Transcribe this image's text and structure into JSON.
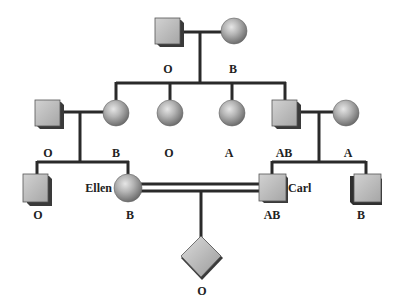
{
  "generations": [
    {
      "name": "grandparents",
      "individuals": [
        {
          "id": "gp-male",
          "sex": "male",
          "shape": "square",
          "blood_type": "O"
        },
        {
          "id": "gp-female",
          "sex": "female",
          "shape": "circle",
          "blood_type": "B"
        }
      ]
    },
    {
      "name": "parents",
      "individuals": [
        {
          "id": "p-left-husband",
          "sex": "male",
          "shape": "square",
          "blood_type": "O"
        },
        {
          "id": "p-daughter-1",
          "sex": "female",
          "shape": "circle",
          "blood_type": "B"
        },
        {
          "id": "p-daughter-2",
          "sex": "female",
          "shape": "circle",
          "blood_type": "O"
        },
        {
          "id": "p-daughter-3",
          "sex": "female",
          "shape": "circle",
          "blood_type": "A"
        },
        {
          "id": "p-son",
          "sex": "male",
          "shape": "square",
          "blood_type": "AB"
        },
        {
          "id": "p-right-wife",
          "sex": "female",
          "shape": "circle",
          "blood_type": "A"
        }
      ]
    },
    {
      "name": "children",
      "individuals": [
        {
          "id": "c-left-son",
          "sex": "male",
          "shape": "square",
          "blood_type": "O"
        },
        {
          "id": "c-ellen",
          "sex": "female",
          "shape": "circle",
          "blood_type": "B",
          "name": "Ellen"
        },
        {
          "id": "c-carl",
          "sex": "male",
          "shape": "square",
          "blood_type": "AB",
          "name": "Carl"
        },
        {
          "id": "c-right-son",
          "sex": "male",
          "shape": "square",
          "blood_type": "B"
        }
      ]
    },
    {
      "name": "offspring",
      "individuals": [
        {
          "id": "o-child",
          "sex": "unknown",
          "shape": "diamond",
          "blood_type": "O"
        }
      ]
    }
  ],
  "labels": {
    "gp_male": "O",
    "gp_female": "B",
    "p_left_husband": "O",
    "p_daughter_1": "B",
    "p_daughter_2": "O",
    "p_daughter_3": "A",
    "p_son": "AB",
    "p_right_wife": "A",
    "c_left_son": "O",
    "c_ellen": "B",
    "c_ellen_name": "Ellen",
    "c_carl": "AB",
    "c_carl_name": "Carl",
    "c_right_son": "B",
    "o_child": "O"
  },
  "relationships": [
    {
      "type": "mating",
      "partners": [
        "gp-male",
        "gp-female"
      ]
    },
    {
      "type": "mating",
      "partners": [
        "p-left-husband",
        "p-daughter-1"
      ]
    },
    {
      "type": "mating",
      "partners": [
        "p-son",
        "p-right-wife"
      ]
    },
    {
      "type": "consanguineous-mating",
      "partners": [
        "c-ellen",
        "c-carl"
      ]
    }
  ]
}
